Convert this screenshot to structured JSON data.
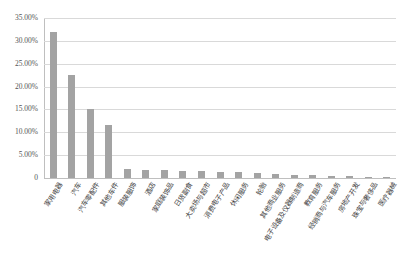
{
  "chart_data": {
    "type": "bar",
    "title": "",
    "subtitle": "",
    "xlabel": "",
    "ylabel": "",
    "ylim": [
      0,
      0.35
    ],
    "grid": true,
    "legend": false,
    "bar_color": "#a3a3a3",
    "grid_color": "#d9d9d9",
    "axis_color": "#bfbfbf",
    "ytick_labels": [
      "35.00%",
      "30.00%",
      "25.00%",
      "20.00%",
      "15.00%",
      "10.00%",
      "5.00%",
      "0"
    ],
    "ytick_values": [
      0.35,
      0.3,
      0.25,
      0.2,
      0.15,
      0.1,
      0.05,
      0.0
    ],
    "categories": [
      "家用电器",
      "汽车",
      "汽车零配件",
      "其他车件",
      "服装服饰",
      "酒店",
      "家庭装饰品",
      "日货副食",
      "大卖场与超市",
      "消费电子产品",
      "休闲服务",
      "轮胎",
      "其他商业服务",
      "电子设备及仪器制造商",
      "教育服务",
      "经销商与汽车服务",
      "房地产开发",
      "珠宝与奢侈品",
      "医疗器械"
    ],
    "values": [
      0.3195,
      0.2245,
      0.15,
      0.115,
      0.02,
      0.0185,
      0.0175,
      0.016,
      0.015,
      0.014,
      0.0125,
      0.0115,
      0.009,
      0.0075,
      0.0062,
      0.0052,
      0.0042,
      0.003,
      0.0022
    ],
    "value_labels": [
      "31.95%",
      "22.45%",
      "15.00%",
      "11.50%",
      "2.00%",
      "1.85%",
      "1.75%",
      "1.60%",
      "1.50%",
      "1.40%",
      "1.25%",
      "1.15%",
      "0.90%",
      "0.75%",
      "0.62%",
      "0.52%",
      "0.42%",
      "0.30%",
      "0.22%"
    ]
  }
}
